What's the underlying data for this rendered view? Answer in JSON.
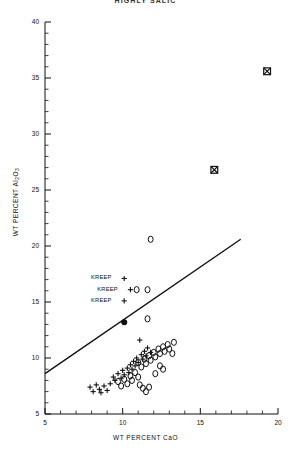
{
  "chart_title": "HIGHLY SALIC",
  "axes": {
    "x_label": "WT  PERCENT  CaO",
    "y_label_prefix": "WT  PERCENT  Al",
    "y_label_sub1": "2",
    "y_label_mid": "O",
    "y_label_sub2": "3"
  },
  "annotations": {
    "kreep_1": "KREEP",
    "kreep_2": "KREEP",
    "kreep_3": "KREEP"
  },
  "chart_data": {
    "type": "scatter",
    "title": "HIGHLY SALIC",
    "xlabel": "WT PERCENT CaO",
    "ylabel": "WT PERCENT Al2O3",
    "xlim": [
      5,
      20
    ],
    "ylim": [
      5,
      40
    ],
    "xticks": [
      5,
      10,
      15,
      20
    ],
    "yticks": [
      5,
      10,
      15,
      20,
      25,
      30,
      35,
      40
    ],
    "x_minor_tick_step": 1,
    "y_minor_tick_step": 1,
    "grid": false,
    "legend": null,
    "series": [
      {
        "name": "crossed-square",
        "marker": "square-with-cross",
        "points": [
          [
            19.3,
            35.6
          ],
          [
            15.9,
            26.8
          ]
        ]
      },
      {
        "name": "open-circle-isolated",
        "marker": "open-circle",
        "points": [
          [
            11.8,
            20.6
          ],
          [
            11.6,
            13.5
          ]
        ]
      },
      {
        "name": "filled-circle",
        "marker": "filled-circle",
        "points": [
          [
            10.1,
            13.2
          ]
        ]
      },
      {
        "name": "kreep-plus",
        "marker": "plus",
        "points": [
          [
            10.1,
            17.1
          ],
          [
            10.5,
            16.1
          ],
          [
            10.1,
            15.1
          ],
          [
            11.1,
            11.6
          ]
        ]
      },
      {
        "name": "kreep-open-circle",
        "marker": "open-circle",
        "points": [
          [
            10.9,
            16.1
          ],
          [
            11.6,
            16.1
          ]
        ]
      },
      {
        "name": "plus-cluster",
        "marker": "plus",
        "points": [
          [
            7.9,
            7.4
          ],
          [
            8.1,
            7.0
          ],
          [
            8.3,
            7.6
          ],
          [
            8.5,
            7.2
          ],
          [
            8.6,
            6.9
          ],
          [
            8.8,
            7.5
          ],
          [
            9.0,
            7.1
          ],
          [
            9.2,
            7.7
          ],
          [
            9.4,
            8.3
          ],
          [
            9.5,
            8.0
          ],
          [
            9.7,
            8.6
          ],
          [
            9.9,
            8.2
          ],
          [
            10.0,
            8.9
          ],
          [
            10.1,
            8.5
          ],
          [
            10.3,
            9.1
          ],
          [
            10.4,
            8.7
          ],
          [
            10.5,
            9.4
          ],
          [
            10.6,
            9.0
          ],
          [
            10.7,
            9.7
          ],
          [
            10.8,
            9.3
          ],
          [
            10.9,
            10.0
          ],
          [
            11.0,
            9.6
          ],
          [
            11.2,
            10.3
          ],
          [
            11.3,
            9.9
          ],
          [
            11.4,
            10.6
          ],
          [
            11.5,
            10.2
          ],
          [
            11.6,
            10.9
          ],
          [
            11.8,
            10.5
          ]
        ]
      },
      {
        "name": "open-circle-cluster",
        "marker": "open-circle",
        "points": [
          [
            9.7,
            7.9
          ],
          [
            9.9,
            7.5
          ],
          [
            10.1,
            8.1
          ],
          [
            10.3,
            7.7
          ],
          [
            10.5,
            8.4
          ],
          [
            10.6,
            8.0
          ],
          [
            10.8,
            8.7
          ],
          [
            11.0,
            8.3
          ],
          [
            11.1,
            7.6
          ],
          [
            11.3,
            7.3
          ],
          [
            11.5,
            7.0
          ],
          [
            11.7,
            7.4
          ],
          [
            11.0,
            9.6
          ],
          [
            11.2,
            9.2
          ],
          [
            11.4,
            9.9
          ],
          [
            11.5,
            9.5
          ],
          [
            11.7,
            10.2
          ],
          [
            11.8,
            9.8
          ],
          [
            12.0,
            10.5
          ],
          [
            12.1,
            10.1
          ],
          [
            12.3,
            10.8
          ],
          [
            12.4,
            10.4
          ],
          [
            12.6,
            11.0
          ],
          [
            12.7,
            10.6
          ],
          [
            12.9,
            11.2
          ],
          [
            13.0,
            10.8
          ],
          [
            13.2,
            10.4
          ],
          [
            13.3,
            11.4
          ],
          [
            12.4,
            9.3
          ],
          [
            12.6,
            9.0
          ],
          [
            12.1,
            8.6
          ]
        ]
      }
    ],
    "reference_line": {
      "name": "trend-line",
      "x0": 5.0,
      "y0": 8.6,
      "x1": 17.6,
      "y1": 20.6
    }
  }
}
